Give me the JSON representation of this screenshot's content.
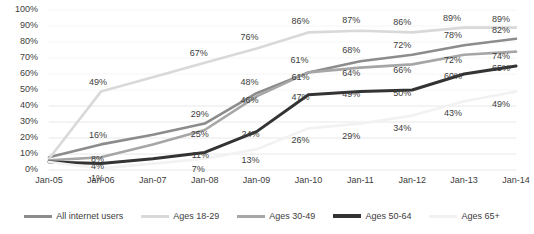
{
  "chart_data": {
    "type": "line",
    "title": "",
    "subtitle": "",
    "xlabel": "",
    "ylabel": "",
    "ylim": [
      0,
      100
    ],
    "ytick_labels": [
      "0%",
      "10%",
      "20%",
      "30%",
      "40%",
      "50%",
      "60%",
      "70%",
      "80%",
      "90%",
      "100%"
    ],
    "yticks": [
      0,
      10,
      20,
      30,
      40,
      50,
      60,
      70,
      80,
      90,
      100
    ],
    "grid": true,
    "legend_position": "bottom",
    "categories": [
      "Jan-05",
      "Jan-06",
      "Jan-07",
      "Jan-08",
      "Jan-09",
      "Jan-10",
      "Jan-11",
      "Jan-12",
      "Jan-13",
      "Jan-14"
    ],
    "series": [
      {
        "name": "All internet users",
        "color": "#8c8c8c",
        "width": 2.6,
        "values": [
          8,
          16,
          22,
          29,
          48,
          61,
          68,
          72,
          78,
          82
        ],
        "labels": [
          "",
          "16%",
          "",
          "29%",
          "48%",
          "61%",
          "68%",
          "72%",
          "78%",
          "82%"
        ]
      },
      {
        "name": "Ages 18-29",
        "color": "#d9d9d9",
        "width": 2.6,
        "values": [
          7,
          49,
          58,
          67,
          76,
          86,
          87,
          86,
          89,
          89
        ],
        "labels": [
          "",
          "49%",
          "",
          "67%",
          "76%",
          "86%",
          "87%",
          "86%",
          "89%",
          "89%"
        ]
      },
      {
        "name": "Ages 30-49",
        "color": "#a6a6a6",
        "width": 2.6,
        "values": [
          6,
          8,
          16,
          25,
          46,
          61,
          64,
          66,
          72,
          74
        ],
        "labels": [
          "",
          "8%",
          "",
          "25%",
          "46%",
          "61%",
          "64%",
          "66%",
          "72%",
          "74%"
        ]
      },
      {
        "name": "Ages 50-64",
        "color": "#333333",
        "width": 3.0,
        "values": [
          5,
          4,
          7,
          11,
          24,
          47,
          49,
          50,
          60,
          65
        ],
        "labels": [
          "",
          "4%",
          "",
          "11%",
          "24%",
          "47%",
          "49%",
          "50%",
          "60%",
          "65%"
        ]
      },
      {
        "name": "Ages 65+",
        "color": "#f2f2f2",
        "width": 2.6,
        "values": [
          5,
          1,
          4,
          7,
          13,
          26,
          29,
          34,
          43,
          49
        ],
        "labels": [
          "",
          "1%",
          "",
          "7%",
          "13%",
          "26%",
          "29%",
          "34%",
          "43%",
          "49%"
        ]
      }
    ]
  },
  "legend": {
    "items": [
      {
        "label": "All internet users",
        "color": "#8c8c8c",
        "thickness": 3
      },
      {
        "label": "Ages 18-29",
        "color": "#d9d9d9",
        "thickness": 3
      },
      {
        "label": "Ages 30-49",
        "color": "#a6a6a6",
        "thickness": 3
      },
      {
        "label": "Ages 50-64",
        "color": "#333333",
        "thickness": 4
      },
      {
        "label": "Ages 65+",
        "color": "#f2f2f2",
        "thickness": 3
      }
    ]
  }
}
